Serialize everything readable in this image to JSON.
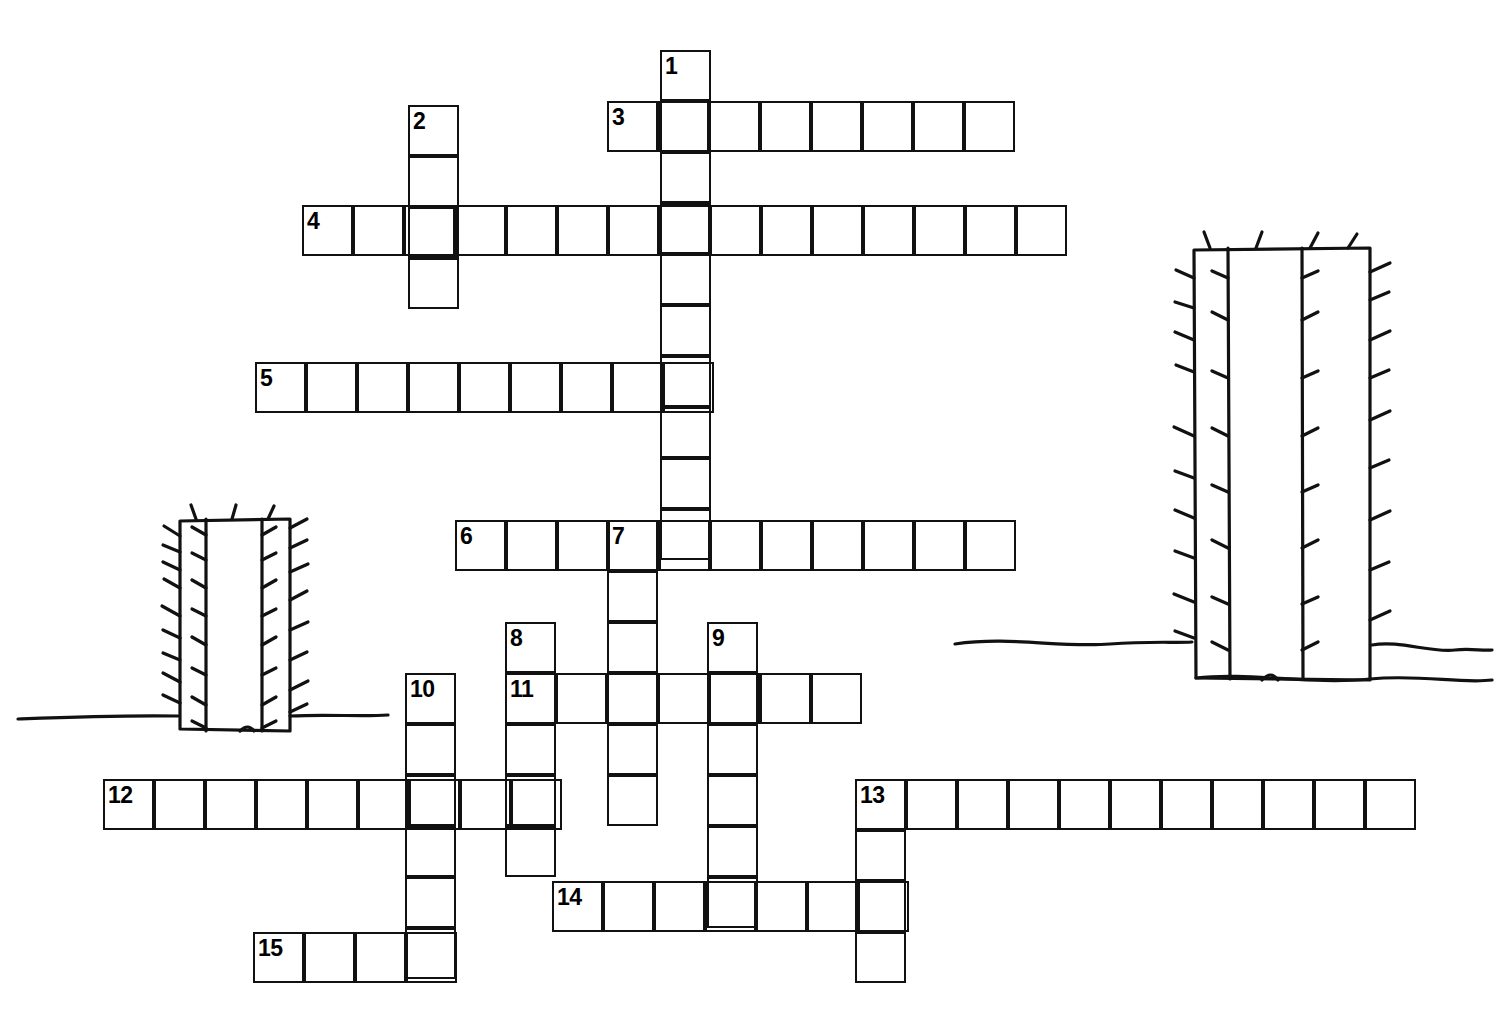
{
  "page": {
    "type": "crossword-grid-worksheet",
    "background_color": "#ffffff",
    "ink_color": "#111111",
    "width": 1497,
    "height": 1022
  },
  "grid": {
    "cell_size": 51,
    "border_width": 2.5,
    "total_clues": 15,
    "numbers_visible": [
      "1",
      "2",
      "3",
      "4",
      "5",
      "6",
      "7",
      "8",
      "9",
      "10",
      "11",
      "12",
      "13",
      "14",
      "15"
    ]
  },
  "entries": [
    {
      "number": "1",
      "direction": "down",
      "x": 660,
      "y": 50,
      "length": 10
    },
    {
      "number": "2",
      "direction": "down",
      "x": 408,
      "y": 105,
      "length": 4
    },
    {
      "number": "3",
      "direction": "across",
      "x": 607,
      "y": 101,
      "length": 8
    },
    {
      "number": "4",
      "direction": "across",
      "x": 302,
      "y": 205,
      "length": 15
    },
    {
      "number": "5",
      "direction": "across",
      "x": 255,
      "y": 362,
      "length": 9
    },
    {
      "number": "6",
      "direction": "across",
      "x": 455,
      "y": 520,
      "length": 11
    },
    {
      "number": "7",
      "direction": "down",
      "x": 607,
      "y": 520,
      "length": 6
    },
    {
      "number": "8",
      "direction": "down",
      "x": 505,
      "y": 622,
      "length": 5
    },
    {
      "number": "9",
      "direction": "down",
      "x": 707,
      "y": 622,
      "length": 6
    },
    {
      "number": "10",
      "direction": "down",
      "x": 405,
      "y": 673,
      "length": 6
    },
    {
      "number": "11",
      "direction": "across",
      "x": 505,
      "y": 673,
      "length": 7
    },
    {
      "number": "12",
      "direction": "across",
      "x": 103,
      "y": 779,
      "length": 9
    },
    {
      "number": "13",
      "direction": "across",
      "x": 855,
      "y": 779,
      "length": 11
    },
    {
      "number": "13",
      "direction": "down",
      "x": 855,
      "y": 779,
      "length": 4
    },
    {
      "number": "14",
      "direction": "across",
      "x": 552,
      "y": 881,
      "length": 7
    },
    {
      "number": "15",
      "direction": "across",
      "x": 253,
      "y": 932,
      "length": 4
    }
  ],
  "decorations": [
    {
      "name": "cactus-left",
      "kind": "saguaro-cactus",
      "x": 178,
      "y": 518,
      "width": 112,
      "height": 215,
      "ground_line_y": 716
    },
    {
      "name": "cactus-right",
      "kind": "saguaro-cactus",
      "x": 1192,
      "y": 246,
      "width": 180,
      "height": 435,
      "ground_line_y": 642
    }
  ]
}
